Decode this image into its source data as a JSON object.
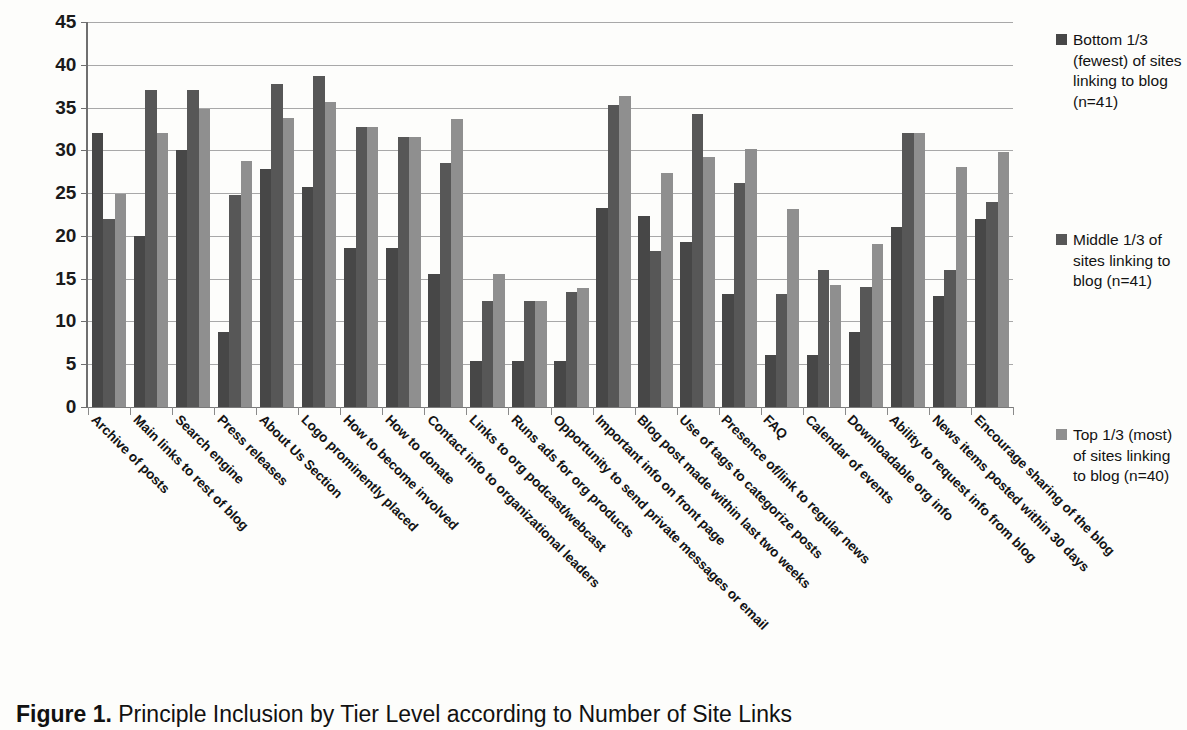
{
  "caption": {
    "label": "Figure 1.",
    "text": " Principle Inclusion by Tier Level according to Number of Site Links"
  },
  "legend": {
    "position": "right",
    "items": [
      {
        "name": "bottom-third",
        "label": "Bottom 1/3 (fewest) of sites linking to blog (n=41)",
        "color": "#474747"
      },
      {
        "name": "middle-third",
        "label": "Middle 1/3 of sites linking to blog (n=41)",
        "color": "#575757"
      },
      {
        "name": "top-third",
        "label": "Top 1/3 (most) of sites linking to blog (n=40)",
        "color": "#8f8f8f"
      }
    ]
  },
  "chart_data": {
    "type": "bar",
    "title": "Principle Inclusion by Tier Level according to Number of Site Links",
    "xlabel": "",
    "ylabel": "",
    "ylim": [
      0,
      45
    ],
    "yticks": [
      0,
      5,
      10,
      15,
      20,
      25,
      30,
      35,
      40,
      45
    ],
    "grid": true,
    "legend_position": "right",
    "categories": [
      "Archive of posts",
      "Main links to rest of blog",
      "Search engine",
      "Press releases",
      "About Us Section",
      "Logo prominently placed",
      "How to become involved",
      "How to donate",
      "Contact info to organizational leaders",
      "Links to org podcast/webcast",
      "Runs ads for org products",
      "Opportunity to send private messages or email",
      "Important info on front page",
      "Blog post made within last two weeks",
      "Use of tags to categorize posts",
      "Presence of/link to regular news",
      "FAQ",
      "Calendar of events",
      "Downloadable org info",
      "Ability to request info from blog",
      "News items posted within 30 days",
      "Encourage sharing of the blog"
    ],
    "series": [
      {
        "name": "Bottom 1/3 (fewest) of sites linking to blog (n=41)",
        "color": "#474747",
        "values": [
          32,
          20,
          30,
          8.8,
          27.8,
          25.7,
          18.6,
          18.6,
          15.5,
          5.4,
          5.4,
          5.4,
          23.3,
          22.3,
          19.3,
          13.2,
          6.1,
          6.1,
          8.8,
          21,
          13,
          22
        ]
      },
      {
        "name": "Middle 1/3 of sites linking to blog (n=41)",
        "color": "#575757",
        "values": [
          22,
          37,
          37,
          24.8,
          37.7,
          38.7,
          32.7,
          31.6,
          28.5,
          12.4,
          12.4,
          13.4,
          35.3,
          18.2,
          34.2,
          26.2,
          13.2,
          16,
          14,
          32,
          16,
          24
        ]
      },
      {
        "name": "Top 1/3 (most) of sites linking to blog (n=40)",
        "color": "#8f8f8f",
        "values": [
          24.9,
          32,
          34.8,
          28.7,
          33.8,
          35.7,
          32.7,
          31.6,
          33.7,
          15.5,
          12.4,
          13.9,
          36.3,
          27.3,
          29.2,
          30.1,
          23.1,
          14.3,
          19,
          32,
          28,
          29.8
        ]
      }
    ]
  }
}
